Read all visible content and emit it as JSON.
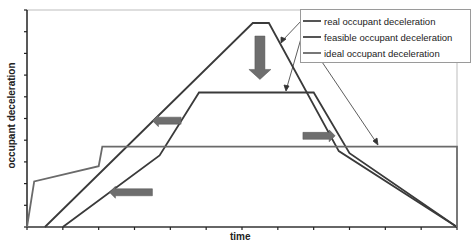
{
  "chart_data": {
    "type": "line",
    "title": "",
    "xlabel": "time",
    "ylabel": "occupant deceleration",
    "xlim": [
      0,
      12
    ],
    "ylim": [
      0,
      10
    ],
    "grid": false,
    "legend_position": "top-right",
    "series": [
      {
        "name": "real occupant deceleration",
        "color": "#3a3a3a",
        "points": [
          [
            0.5,
            0
          ],
          [
            6.3,
            9.4
          ],
          [
            6.75,
            9.4
          ],
          [
            8.7,
            3.5
          ],
          [
            12,
            0
          ]
        ]
      },
      {
        "name": "feasible occupant deceleration",
        "color": "#3a3a3a",
        "points": [
          [
            1.0,
            0
          ],
          [
            3.7,
            3.3
          ],
          [
            4.8,
            6.2
          ],
          [
            8.0,
            6.2
          ],
          [
            9.0,
            3.4
          ],
          [
            12,
            0
          ]
        ]
      },
      {
        "name": "ideal occupant deceleration",
        "color": "#6a6a6a",
        "points": [
          [
            0,
            0
          ],
          [
            0.2,
            2.1
          ],
          [
            2.0,
            2.8
          ],
          [
            2.1,
            3.7
          ],
          [
            12,
            3.7
          ],
          [
            12,
            0
          ]
        ]
      }
    ],
    "annotations": [
      {
        "type": "arrow",
        "direction": "down",
        "x": 6.5,
        "y_from": 8.8,
        "y_to": 6.8,
        "desc": "real peak lowered toward feasible"
      },
      {
        "type": "arrow",
        "direction": "left",
        "x_from": 4.3,
        "x_to": 3.5,
        "y": 4.9,
        "desc": "feasible rise shifted earlier"
      },
      {
        "type": "arrow",
        "direction": "left",
        "x_from": 3.5,
        "x_to": 2.3,
        "y": 1.6,
        "desc": "real rise shifted earlier"
      },
      {
        "type": "arrow",
        "direction": "right",
        "x_from": 7.7,
        "x_to": 8.6,
        "y": 4.2,
        "desc": "fall shifted later"
      }
    ]
  },
  "axes": {
    "xlabel": "time",
    "ylabel": "occupant deceleration"
  },
  "legend": {
    "items": [
      {
        "label": "real occupant deceleration"
      },
      {
        "label": "feasible occupant deceleration"
      },
      {
        "label": "ideal occupant deceleration"
      }
    ]
  }
}
